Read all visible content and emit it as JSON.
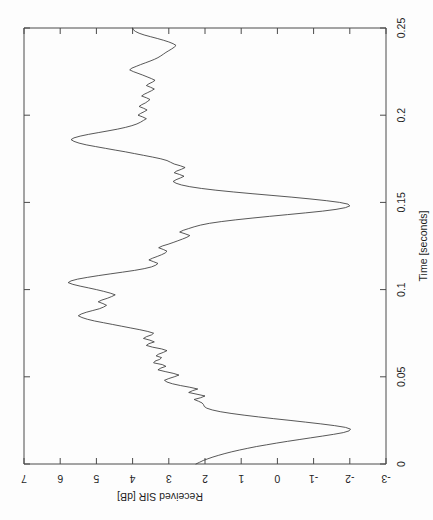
{
  "figure": {
    "orientation": "rotated-90-ccw",
    "background_color": "#fdfdfd",
    "line_color": "#3a3a3a",
    "axis_color": "#4a4a4a"
  },
  "chart_data": {
    "type": "line",
    "title": "",
    "xlabel": "Time [seconds]",
    "ylabel": "Received SIR [dB]",
    "xlim": [
      0,
      0.25
    ],
    "ylim": [
      -3,
      7
    ],
    "xticks": [
      0,
      0.05,
      0.1,
      0.15,
      0.2,
      0.25
    ],
    "xtick_labels": [
      "0",
      "0.05",
      "0.1",
      "0.15",
      "0.2",
      "0.25"
    ],
    "yticks": [
      -3,
      -2,
      -1,
      0,
      1,
      2,
      3,
      4,
      5,
      6,
      7
    ],
    "ytick_labels": [
      "-3",
      "-2",
      "-1",
      "0",
      "1",
      "2",
      "3",
      "4",
      "5",
      "6",
      "7"
    ],
    "grid": false,
    "legend": null,
    "series": [
      {
        "name": "Received SIR",
        "x": [
          0.0,
          0.001,
          0.002,
          0.003,
          0.004,
          0.005,
          0.006,
          0.007,
          0.008,
          0.009,
          0.01,
          0.011,
          0.012,
          0.013,
          0.014,
          0.015,
          0.016,
          0.017,
          0.018,
          0.019,
          0.02,
          0.021,
          0.022,
          0.023,
          0.024,
          0.025,
          0.026,
          0.027,
          0.028,
          0.029,
          0.03,
          0.031,
          0.032,
          0.033,
          0.034,
          0.035,
          0.036,
          0.037,
          0.038,
          0.039,
          0.04,
          0.041,
          0.042,
          0.043,
          0.044,
          0.045,
          0.046,
          0.047,
          0.048,
          0.049,
          0.05,
          0.051,
          0.052,
          0.053,
          0.054,
          0.055,
          0.056,
          0.057,
          0.058,
          0.059,
          0.06,
          0.061,
          0.062,
          0.063,
          0.064,
          0.065,
          0.066,
          0.067,
          0.068,
          0.069,
          0.07,
          0.071,
          0.072,
          0.073,
          0.074,
          0.075,
          0.076,
          0.077,
          0.078,
          0.079,
          0.08,
          0.081,
          0.082,
          0.083,
          0.084,
          0.085,
          0.086,
          0.087,
          0.088,
          0.089,
          0.09,
          0.091,
          0.092,
          0.093,
          0.094,
          0.095,
          0.096,
          0.097,
          0.098,
          0.099,
          0.1,
          0.101,
          0.102,
          0.103,
          0.104,
          0.105,
          0.106,
          0.107,
          0.108,
          0.109,
          0.11,
          0.111,
          0.112,
          0.113,
          0.114,
          0.115,
          0.116,
          0.117,
          0.118,
          0.119,
          0.12,
          0.121,
          0.122,
          0.123,
          0.124,
          0.125,
          0.126,
          0.127,
          0.128,
          0.129,
          0.13,
          0.131,
          0.132,
          0.133,
          0.134,
          0.135,
          0.136,
          0.137,
          0.138,
          0.139,
          0.14,
          0.141,
          0.142,
          0.143,
          0.144,
          0.145,
          0.146,
          0.147,
          0.148,
          0.149,
          0.15,
          0.151,
          0.152,
          0.153,
          0.154,
          0.155,
          0.156,
          0.157,
          0.158,
          0.159,
          0.16,
          0.161,
          0.162,
          0.163,
          0.164,
          0.165,
          0.166,
          0.167,
          0.168,
          0.169,
          0.17,
          0.171,
          0.172,
          0.173,
          0.174,
          0.175,
          0.176,
          0.177,
          0.178,
          0.179,
          0.18,
          0.181,
          0.182,
          0.183,
          0.184,
          0.185,
          0.186,
          0.187,
          0.188,
          0.189,
          0.19,
          0.191,
          0.192,
          0.193,
          0.194,
          0.195,
          0.196,
          0.197,
          0.198,
          0.199,
          0.2,
          0.201,
          0.202,
          0.203,
          0.204,
          0.205,
          0.206,
          0.207,
          0.208,
          0.209,
          0.21,
          0.211,
          0.212,
          0.213,
          0.214,
          0.215,
          0.216,
          0.217,
          0.218,
          0.219,
          0.22,
          0.221,
          0.222,
          0.223,
          0.224,
          0.225,
          0.226,
          0.227,
          0.228,
          0.229,
          0.23,
          0.231,
          0.232,
          0.233,
          0.234,
          0.235,
          0.236,
          0.237,
          0.238,
          0.239,
          0.24,
          0.241,
          0.242,
          0.243,
          0.244,
          0.245,
          0.246,
          0.247,
          0.248,
          0.249,
          0.25
        ],
        "y": [
          2.25,
          2.15,
          2.05,
          1.92,
          1.78,
          1.62,
          1.45,
          1.26,
          1.05,
          0.82,
          0.58,
          0.3,
          0.02,
          -0.28,
          -0.6,
          -0.92,
          -1.24,
          -1.55,
          -1.82,
          -1.98,
          -2.02,
          -1.88,
          -1.58,
          -1.2,
          -0.78,
          -0.35,
          0.1,
          0.52,
          0.92,
          1.28,
          1.58,
          1.8,
          1.95,
          2.02,
          2.04,
          2.08,
          2.18,
          2.3,
          2.12,
          2.0,
          2.22,
          2.45,
          2.35,
          2.2,
          2.42,
          2.68,
          2.9,
          3.05,
          3.12,
          3.0,
          2.85,
          2.72,
          2.88,
          3.1,
          3.3,
          3.22,
          3.08,
          3.18,
          3.42,
          3.38,
          3.25,
          3.2,
          3.35,
          3.28,
          3.15,
          3.05,
          3.2,
          3.45,
          3.62,
          3.55,
          3.4,
          3.52,
          3.7,
          3.62,
          3.48,
          3.42,
          3.58,
          3.8,
          4.05,
          4.3,
          4.55,
          4.8,
          5.05,
          5.25,
          5.4,
          5.5,
          5.42,
          5.28,
          5.1,
          4.92,
          4.8,
          4.72,
          4.82,
          4.95,
          4.85,
          4.7,
          4.58,
          4.48,
          4.62,
          4.8,
          5.0,
          5.22,
          5.45,
          5.65,
          5.78,
          5.7,
          5.52,
          5.25,
          4.95,
          4.62,
          4.28,
          3.95,
          3.68,
          3.48,
          3.36,
          3.3,
          3.42,
          3.55,
          3.45,
          3.32,
          3.2,
          3.1,
          3.05,
          3.15,
          3.28,
          3.18,
          3.02,
          2.88,
          2.75,
          2.62,
          2.5,
          2.42,
          2.55,
          2.7,
          2.6,
          2.45,
          2.3,
          2.12,
          1.88,
          1.55,
          1.15,
          0.7,
          0.22,
          -0.28,
          -0.78,
          -1.25,
          -1.62,
          -1.88,
          -2.0,
          -1.95,
          -1.72,
          -1.35,
          -0.9,
          -0.4,
          0.15,
          0.7,
          1.22,
          1.7,
          2.1,
          2.42,
          2.65,
          2.8,
          2.88,
          2.8,
          2.68,
          2.58,
          2.7,
          2.85,
          2.78,
          2.65,
          2.55,
          2.68,
          2.85,
          2.95,
          3.05,
          3.22,
          3.45,
          3.7,
          3.95,
          4.2,
          4.48,
          4.75,
          5.02,
          5.28,
          5.48,
          5.62,
          5.7,
          5.62,
          5.45,
          5.22,
          4.95,
          4.68,
          4.42,
          4.2,
          4.02,
          3.88,
          3.78,
          3.7,
          3.62,
          3.72,
          3.85,
          3.78,
          3.68,
          3.6,
          3.7,
          3.82,
          3.75,
          3.65,
          3.58,
          3.52,
          3.62,
          3.75,
          3.68,
          3.58,
          3.48,
          3.4,
          3.5,
          3.62,
          3.55,
          3.45,
          3.38,
          3.48,
          3.6,
          3.72,
          3.85,
          3.98,
          4.08,
          4.02,
          3.9,
          3.78,
          3.65,
          3.52,
          3.4,
          3.3,
          3.22,
          3.15,
          3.08,
          3.0,
          2.92,
          2.85,
          2.8,
          2.88,
          3.0,
          3.15,
          3.32,
          3.5,
          3.68,
          3.82,
          3.92,
          3.98,
          4.0
        ]
      }
    ],
    "annotations": []
  }
}
